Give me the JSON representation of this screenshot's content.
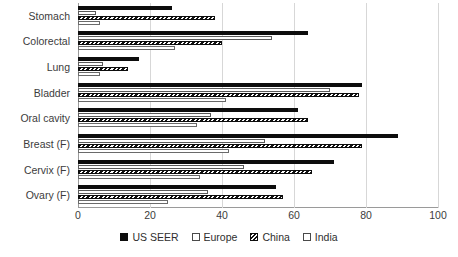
{
  "chart_data": {
    "type": "bar",
    "orientation": "horizontal",
    "title": "",
    "xlabel": "",
    "ylabel": "",
    "xlim": [
      0,
      100
    ],
    "xticks": [
      0,
      20,
      40,
      60,
      80,
      100
    ],
    "grid": true,
    "legend_position": "bottom",
    "categories": [
      "Stomach",
      "Colorectal",
      "Lung",
      "Bladder",
      "Oral cavity",
      "Breast (F)",
      "Cervix (F)",
      "Ovary (F)"
    ],
    "series": [
      {
        "name": "US SEER",
        "fill": "solid-black",
        "color": "#0d0d0d",
        "values": [
          26,
          64,
          17,
          79,
          61,
          89,
          71,
          55
        ]
      },
      {
        "name": "Europe",
        "fill": "white-outline",
        "color": "#ffffff",
        "values": [
          5,
          54,
          7,
          70,
          37,
          52,
          46,
          36
        ]
      },
      {
        "name": "China",
        "fill": "hatched",
        "color": "#111111",
        "values": [
          38,
          40,
          14,
          78,
          64,
          79,
          65,
          57
        ]
      },
      {
        "name": "India",
        "fill": "white-outline",
        "color": "#ffffff",
        "values": [
          6,
          27,
          6,
          41,
          33,
          42,
          34,
          25
        ]
      }
    ]
  },
  "legend": {
    "items": [
      {
        "label": "US SEER"
      },
      {
        "label": "Europe"
      },
      {
        "label": "China"
      },
      {
        "label": "India"
      }
    ]
  }
}
